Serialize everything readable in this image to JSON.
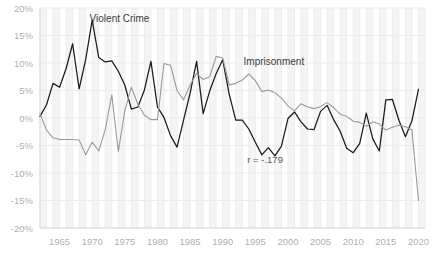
{
  "chart_data": {
    "type": "line",
    "title": "",
    "subtitle": "",
    "xlabel": "",
    "ylabel": "",
    "xlim": [
      1962,
      2021
    ],
    "ylim": [
      -20,
      20
    ],
    "grid": true,
    "legend_position": "inline-annotations",
    "y_ticks": [
      20,
      15,
      10,
      5,
      0,
      -5,
      -10,
      -15,
      -20
    ],
    "y_tick_labels": [
      "20%",
      "15%",
      "10%",
      "5%",
      "0%",
      "-5%",
      "-10%",
      "-15%",
      "-20%"
    ],
    "x_ticks": [
      1965,
      1970,
      1975,
      1980,
      1985,
      1990,
      1995,
      2000,
      2005,
      2010,
      2015,
      2020
    ],
    "x_tick_labels": [
      "1965",
      "1970",
      "1975",
      "1980",
      "1985",
      "1990",
      "1995",
      "2000",
      "2005",
      "2010",
      "2015",
      "2020"
    ],
    "x": [
      1962,
      1963,
      1964,
      1965,
      1966,
      1967,
      1968,
      1969,
      1970,
      1971,
      1972,
      1973,
      1974,
      1975,
      1976,
      1977,
      1978,
      1979,
      1980,
      1981,
      1982,
      1983,
      1984,
      1985,
      1986,
      1987,
      1988,
      1989,
      1990,
      1991,
      1992,
      1993,
      1994,
      1995,
      1996,
      1997,
      1998,
      1999,
      2000,
      2001,
      2002,
      2003,
      2004,
      2005,
      2006,
      2007,
      2008,
      2009,
      2010,
      2011,
      2012,
      2013,
      2014,
      2015,
      2016,
      2017,
      2018,
      2019,
      2020
    ],
    "series": [
      {
        "name": "Violent Crime",
        "color": "#1a1a1a",
        "label_x": 1969.6,
        "label_y": 17.4,
        "values": [
          0.3,
          2.4,
          6.3,
          5.6,
          9.0,
          13.5,
          5.3,
          10.6,
          17.8,
          11.0,
          10.2,
          10.4,
          8.5,
          6.0,
          1.6,
          2.0,
          5.1,
          10.3,
          2.0,
          0.1,
          -3.2,
          -5.3,
          -0.4,
          4.5,
          10.3,
          0.8,
          4.9,
          8.1,
          10.6,
          4.3,
          -0.4,
          -0.4,
          -2.0,
          -4.4,
          -6.7,
          -5.4,
          -6.9,
          -5.1,
          -0.1,
          1.1,
          -0.7,
          -2.0,
          -2.1,
          1.2,
          2.3,
          -0.3,
          -2.4,
          -5.5,
          -6.3,
          -4.6,
          0.9,
          -3.8,
          -6.0,
          3.3,
          3.4,
          -0.4,
          -3.4,
          -0.5,
          5.2
        ]
      },
      {
        "name": "Imprisonment",
        "color": "#9a9a9a",
        "label_x": 1993.2,
        "label_y": 9.6,
        "values": [
          0.8,
          -2.2,
          -3.6,
          -3.9,
          -3.9,
          -3.9,
          -4.0,
          -6.7,
          -4.4,
          -6.0,
          -2.1,
          4.2,
          -6.1,
          1.3,
          5.6,
          2.5,
          0.5,
          -0.3,
          -0.3,
          9.9,
          9.6,
          5.0,
          3.3,
          6.0,
          8.1,
          7.0,
          7.5,
          11.2,
          10.9,
          6.0,
          6.3,
          6.9,
          8.0,
          6.8,
          4.8,
          5.1,
          4.6,
          3.6,
          2.2,
          1.3,
          2.6,
          2.0,
          1.7,
          2.1,
          2.8,
          1.9,
          0.7,
          0.3,
          -0.6,
          -0.8,
          -1.5,
          -0.7,
          -1.1,
          -2.2,
          -1.7,
          -1.3,
          -1.6,
          -2.2,
          -15.0
        ]
      }
    ],
    "annotations": [
      {
        "text": "r = -.179",
        "x": 1996.5,
        "y": -8.2
      }
    ]
  }
}
